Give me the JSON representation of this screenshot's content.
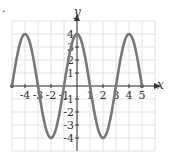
{
  "chart_data": {
    "type": "line",
    "title": "",
    "xlabel": "x",
    "ylabel": "y",
    "xlim": [
      -5,
      5
    ],
    "ylim": [
      -4,
      4
    ],
    "grid": true,
    "function": "y = 4cos(pi*x/2)",
    "x_ticks": [
      "-4",
      "-3",
      "-2",
      "-1",
      "1",
      "2",
      "3",
      "4",
      "5"
    ],
    "y_ticks": [
      "4",
      "3",
      "2",
      "1",
      "-1",
      "-2",
      "-3",
      "-4"
    ],
    "series": [
      {
        "name": "curve",
        "color": "#777777",
        "x": [
          -5,
          -4,
          -3,
          -2,
          -1,
          0,
          1,
          2,
          3,
          4,
          5
        ],
        "y": [
          0,
          4,
          0,
          -4,
          0,
          4,
          0,
          -4,
          0,
          4,
          0
        ]
      }
    ]
  },
  "labels": {
    "x_axis": "x",
    "y_axis": "y",
    "bullet": "."
  }
}
